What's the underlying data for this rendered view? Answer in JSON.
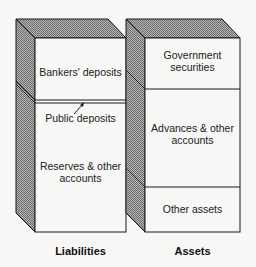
{
  "diagram": {
    "type": "balance-sheet-blocks",
    "colors": {
      "hatch_fill": "#9a9a9a",
      "face_fill": "#f7f7f5",
      "stroke": "#1a1a1a"
    },
    "liabilities": {
      "title": "Liabilities",
      "sections": [
        {
          "label": "Bankers' deposits"
        },
        {
          "label": "Public deposits"
        },
        {
          "label": "Reserves & other accounts"
        }
      ]
    },
    "assets": {
      "title": "Assets",
      "sections": [
        {
          "label": "Government securities"
        },
        {
          "label": "Advances & other accounts"
        },
        {
          "label": "Other assets"
        }
      ]
    }
  }
}
